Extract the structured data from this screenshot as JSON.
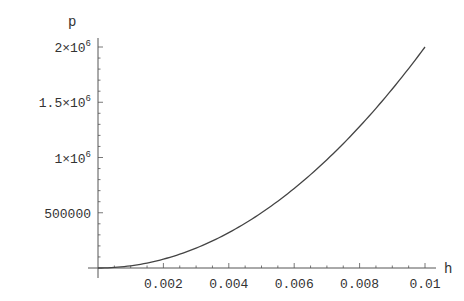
{
  "chart_data": {
    "type": "line",
    "title": "",
    "xlabel": "h",
    "ylabel": "p",
    "xlim": [
      0,
      0.01
    ],
    "ylim": [
      0,
      2000000
    ],
    "grid": false,
    "legend": null,
    "x_ticks": [
      {
        "value": 0.002,
        "label": "0.002"
      },
      {
        "value": 0.004,
        "label": "0.004"
      },
      {
        "value": 0.006,
        "label": "0.006"
      },
      {
        "value": 0.008,
        "label": "0.008"
      },
      {
        "value": 0.01,
        "label": "0.01"
      }
    ],
    "y_ticks": [
      {
        "value": 500000,
        "label": "500000",
        "mant": "500000",
        "exp": ""
      },
      {
        "value": 1000000,
        "label": "1×10^6",
        "mant": "1×10",
        "exp": "6"
      },
      {
        "value": 1500000,
        "label": "1.5×10^6",
        "mant": "1.5×10",
        "exp": "6"
      },
      {
        "value": 2000000,
        "label": "2×10^6",
        "mant": "2×10",
        "exp": "6"
      }
    ],
    "series": [
      {
        "name": "p(h)",
        "x": [
          0,
          0.001,
          0.002,
          0.003,
          0.004,
          0.005,
          0.006,
          0.007,
          0.008,
          0.009,
          0.01
        ],
        "y": [
          0,
          20000,
          80000,
          180000,
          320000,
          500000,
          720000,
          980000,
          1280000,
          1620000,
          2000000
        ]
      }
    ]
  },
  "colors": {
    "axis": "#555555",
    "curve": "#444444",
    "text": "#333333",
    "background": "#ffffff"
  }
}
